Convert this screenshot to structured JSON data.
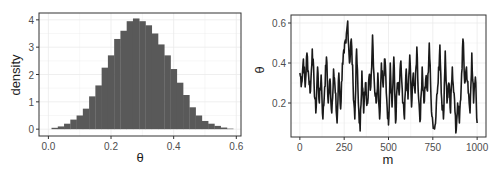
{
  "chart_data": [
    {
      "type": "bar",
      "subtype": "histogram",
      "title": "",
      "xlabel": "θ",
      "ylabel": "density",
      "xlim": [
        -0.03,
        0.615
      ],
      "ylim": [
        -0.25,
        4.25
      ],
      "xticks": [
        0.0,
        0.2,
        0.4,
        0.6
      ],
      "xtick_labels": [
        "0.0",
        "0.2",
        "0.4",
        "0.6"
      ],
      "yticks": [
        0,
        1,
        2,
        3,
        4
      ],
      "ytick_labels": [
        "0",
        "1",
        "2",
        "3",
        "4"
      ],
      "grid": true,
      "bin_width": 0.02,
      "bin_start": 0.01,
      "fill": "#595959",
      "bins": [
        0.05,
        0.1,
        0.2,
        0.35,
        0.5,
        0.75,
        1.2,
        1.6,
        2.25,
        2.7,
        3.3,
        3.6,
        3.95,
        4.05,
        3.95,
        3.8,
        3.5,
        3.1,
        2.7,
        2.2,
        1.7,
        1.25,
        0.8,
        0.5,
        0.3,
        0.2,
        0.12,
        0.06,
        0.02
      ]
    },
    {
      "type": "line",
      "title": "",
      "xlabel": "m",
      "ylabel": "θ",
      "xlim": [
        -50,
        1050
      ],
      "ylim": [
        0.03,
        0.64
      ],
      "xticks": [
        0,
        250,
        500,
        750,
        1000
      ],
      "xtick_labels": [
        "0",
        "250",
        "500",
        "750",
        "1000"
      ],
      "yticks": [
        0.2,
        0.4,
        0.6
      ],
      "ytick_labels": [
        "0.2",
        "0.4",
        "0.6"
      ],
      "grid": true,
      "line_color": "#1a1a1a",
      "x_step": 10,
      "values": [
        0.35,
        0.3,
        0.42,
        0.28,
        0.45,
        0.33,
        0.26,
        0.47,
        0.3,
        0.15,
        0.38,
        0.2,
        0.34,
        0.12,
        0.28,
        0.43,
        0.2,
        0.32,
        0.15,
        0.37,
        0.25,
        0.1,
        0.35,
        0.17,
        0.4,
        0.45,
        0.5,
        0.61,
        0.4,
        0.52,
        0.3,
        0.12,
        0.47,
        0.2,
        0.06,
        0.36,
        0.15,
        0.3,
        0.2,
        0.33,
        0.28,
        0.54,
        0.3,
        0.2,
        0.35,
        0.12,
        0.4,
        0.28,
        0.42,
        0.22,
        0.09,
        0.4,
        0.18,
        0.43,
        0.1,
        0.3,
        0.24,
        0.41,
        0.2,
        0.12,
        0.37,
        0.22,
        0.44,
        0.18,
        0.35,
        0.25,
        0.48,
        0.22,
        0.12,
        0.38,
        0.2,
        0.32,
        0.26,
        0.5,
        0.22,
        0.1,
        0.07,
        0.2,
        0.3,
        0.49,
        0.22,
        0.12,
        0.46,
        0.2,
        0.3,
        0.15,
        0.38,
        0.25,
        0.05,
        0.2,
        0.1,
        0.28,
        0.52,
        0.3,
        0.38,
        0.25,
        0.15,
        0.45,
        0.2,
        0.33,
        0.1
      ],
      "trace_summary": "1000 iterations of a θ trace; values mostly between ~0.05 and ~0.6, centered around 0.28"
    }
  ]
}
